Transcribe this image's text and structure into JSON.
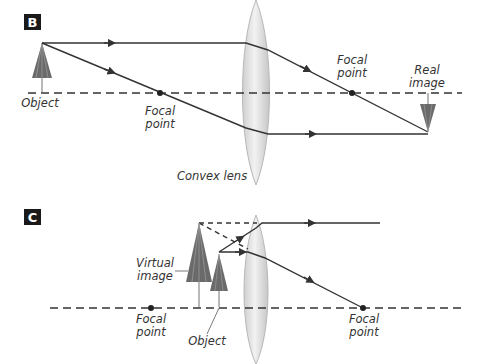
{
  "panels": [
    {
      "id": "B",
      "badge": "B",
      "labels": {
        "object": "Object",
        "focal_left_1": "Focal",
        "focal_left_2": "point",
        "focal_right_1": "Focal",
        "focal_right_2": "point",
        "real_image_1": "Real",
        "real_image_2": "image",
        "lens": "Convex lens"
      }
    },
    {
      "id": "C",
      "badge": "C",
      "labels": {
        "virtual_image_1": "Virtual",
        "virtual_image_2": "image",
        "focal_left_1": "Focal",
        "focal_left_2": "point",
        "object": "Object",
        "focal_right_1": "Focal",
        "focal_right_2": "point"
      }
    }
  ],
  "colors": {
    "ray": "#333333",
    "lens_fill": "#e4e4e4",
    "lens_edge": "#b8b8b8",
    "umbrella": "#6a6a6a",
    "badge_bg": "#1a1a1a"
  }
}
